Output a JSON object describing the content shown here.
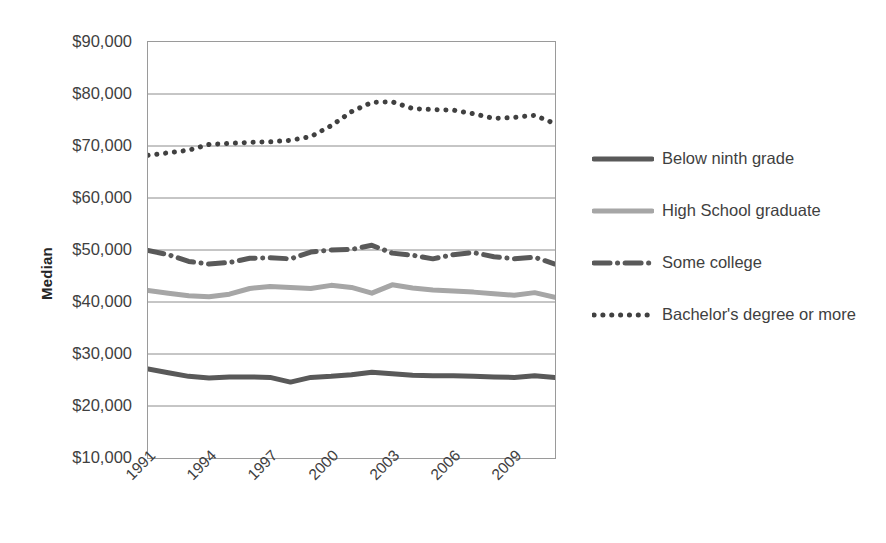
{
  "chart_data": {
    "type": "line",
    "title": "",
    "xlabel": "",
    "ylabel": "Median",
    "ylim": [
      10000,
      90000
    ],
    "xlim": [
      1991,
      2011
    ],
    "grid": true,
    "legend_position": "right",
    "y_tick_labels": [
      "$90,000",
      "$80,000",
      "$70,000",
      "$60,000",
      "$50,000",
      "$40,000",
      "$30,000",
      "$20,000",
      "$10,000"
    ],
    "y_tick_values": [
      90000,
      80000,
      70000,
      60000,
      50000,
      40000,
      30000,
      20000,
      10000
    ],
    "x_tick_labels": [
      "1991",
      "1994",
      "1997",
      "2000",
      "2003",
      "2006",
      "2009"
    ],
    "x_tick_values": [
      1991,
      1994,
      1997,
      2000,
      2003,
      2006,
      2009
    ],
    "x": [
      1991,
      1992,
      1993,
      1994,
      1995,
      1996,
      1997,
      1998,
      1999,
      2000,
      2001,
      2002,
      2003,
      2004,
      2005,
      2006,
      2007,
      2008,
      2009,
      2010,
      2011
    ],
    "series": [
      {
        "name": "Below ninth grade",
        "style": "solid",
        "color": "#595959",
        "width": 5,
        "values": [
          27100,
          26400,
          25700,
          25400,
          25600,
          25600,
          25500,
          24600,
          25500,
          25700,
          26000,
          26500,
          26200,
          25900,
          25800,
          25800,
          25700,
          25600,
          25500,
          25800,
          25500
        ]
      },
      {
        "name": "High School graduate",
        "style": "solid",
        "color": "#a6a6a6",
        "width": 5,
        "values": [
          42200,
          41700,
          41200,
          41000,
          41500,
          42600,
          43000,
          42800,
          42600,
          43200,
          42800,
          41700,
          43300,
          42700,
          42300,
          42100,
          41900,
          41600,
          41300,
          41800,
          40900
        ]
      },
      {
        "name": "Some college",
        "style": "dashdot",
        "color": "#595959",
        "width": 5,
        "values": [
          49900,
          49100,
          47800,
          47300,
          47600,
          48400,
          48500,
          48300,
          49600,
          50000,
          50100,
          50900,
          49400,
          49000,
          48300,
          49100,
          49500,
          48700,
          48300,
          48600,
          47300
        ]
      },
      {
        "name": "Bachelor's degree or more",
        "style": "dotted",
        "color": "#404040",
        "width": 5,
        "values": [
          68200,
          68700,
          69200,
          70300,
          70500,
          70700,
          70800,
          71100,
          71800,
          73900,
          76600,
          78400,
          78500,
          77200,
          77000,
          76900,
          76200,
          75300,
          75500,
          75900,
          76600
        ]
      }
    ],
    "series_render": [
      {
        "name": "Bachelor's degree or more",
        "values": [
          68200,
          68700,
          69200,
          70300,
          70500,
          70700,
          70800,
          71100,
          71800,
          73900,
          76600,
          78400,
          78500,
          77200,
          77000,
          76900,
          76200,
          75300,
          75500,
          75900,
          74300
        ]
      }
    ]
  },
  "legend": {
    "items": [
      {
        "label": "Below ninth grade",
        "style": "solid",
        "color": "#595959"
      },
      {
        "label": "High School graduate",
        "style": "solid",
        "color": "#a6a6a6"
      },
      {
        "label": "Some college",
        "style": "dashdot",
        "color": "#595959"
      },
      {
        "label": "Bachelor's degree or more",
        "style": "dotted",
        "color": "#404040"
      }
    ]
  },
  "axes": {
    "y_title": "Median"
  },
  "colors": {
    "axis_line": "#9a9a9a",
    "grid": "#8c8c8c",
    "tick_text": "#3f3f3f",
    "dark_series": "#595959",
    "light_series": "#a6a6a6",
    "dot_series": "#404040"
  }
}
